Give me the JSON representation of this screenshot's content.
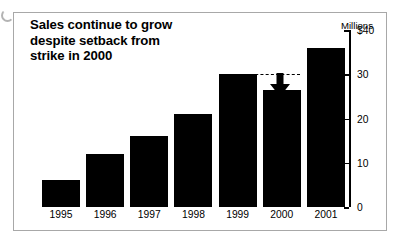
{
  "figure": {
    "artifact_name": "scan-artifact"
  },
  "chart_data": {
    "type": "bar",
    "title": "Sales continue to grow despite setback from strike in 2000",
    "title_lines": [
      "Sales continue to grow",
      "despite setback from",
      "strike in 2000"
    ],
    "categories": [
      "1995",
      "1996",
      "1997",
      "1998",
      "1999",
      "2000",
      "2001"
    ],
    "values": [
      6,
      12,
      16,
      21,
      30,
      26.5,
      36
    ],
    "xlabel": "",
    "ylabel": "Millions",
    "ylim": [
      0,
      40
    ],
    "yticks": [
      0,
      10,
      20,
      30,
      40
    ],
    "ytick_labels": [
      "0",
      "10",
      "20",
      "30",
      "$40"
    ],
    "grid": false,
    "legend": false,
    "bar_color": "#000000",
    "annotations": [
      {
        "name": "setback-arrow",
        "type": "arrow-down",
        "from_value": 30,
        "to_value": 26.5,
        "at_category": "2000",
        "note": "dashed reference line at 30 with downward arrow marking the 2000 strike setback"
      }
    ]
  }
}
